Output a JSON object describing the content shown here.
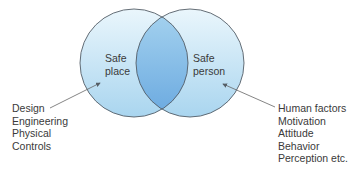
{
  "diagram": {
    "type": "venn",
    "colors": {
      "circle_fill_light": "#e6f4fb",
      "circle_fill_mid": "#b9def2",
      "intersection_fill": "#7fb9e6",
      "stroke": "#555e66",
      "text": "#3a3a3a"
    },
    "left_circle": {
      "label_line1": "Safe",
      "label_line2": "place"
    },
    "right_circle": {
      "label_line1": "Safe",
      "label_line2": "person"
    },
    "left_annotation": [
      "Design",
      "Engineering",
      "Physical",
      "Controls"
    ],
    "right_annotation": [
      "Human factors",
      "Motivation",
      "Attitude",
      "Behavior",
      "Perception etc."
    ]
  }
}
